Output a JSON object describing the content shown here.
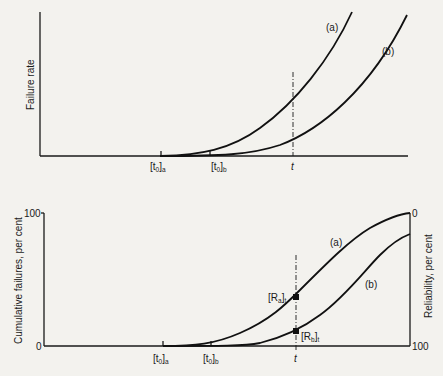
{
  "top_chart": {
    "ylabel": "Failure rate",
    "curves": [
      {
        "id": "a",
        "label": "(a)"
      },
      {
        "id": "b",
        "label": "(b)"
      }
    ],
    "x_ticks": [
      {
        "main": "[t",
        "sub0": "0",
        "close": "]",
        "subscript": "a"
      },
      {
        "main": "[t",
        "sub0": "0",
        "close": "]",
        "subscript": "b"
      },
      {
        "main": "t"
      }
    ]
  },
  "bottom_chart": {
    "ylabel_left": "Cumulative failures, per cent",
    "ylabel_right": "Reliability, per cent",
    "left_ticks": {
      "top": "100",
      "bottom": "0"
    },
    "right_ticks": {
      "top": "0",
      "bottom": "100"
    },
    "curves": [
      {
        "id": "a",
        "label": "(a)"
      },
      {
        "id": "b",
        "label": "(b)"
      }
    ],
    "points": [
      {
        "main": "[R",
        "sub": "a",
        "close": "]",
        "subscript": "t"
      },
      {
        "main": "[R",
        "sub": "b",
        "close": "]",
        "subscript": "t"
      }
    ],
    "x_ticks": [
      {
        "main": "[t",
        "sub0": "0",
        "close": "]",
        "subscript": "a"
      },
      {
        "main": "[t",
        "sub0": "0",
        "close": "]",
        "subscript": "b"
      },
      {
        "main": "t"
      }
    ]
  }
}
